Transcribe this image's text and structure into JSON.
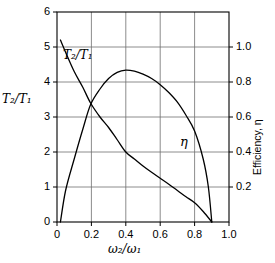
{
  "chart_data": {
    "type": "line",
    "title": "",
    "xlabel": "ω₂/ω₁",
    "ylabel_left": "T₂/T₁",
    "ylabel_right": "Efficiency, η",
    "xlim": [
      0.0,
      1.0
    ],
    "ylim_left": [
      0,
      6
    ],
    "ylim_right": [
      0.0,
      1.2
    ],
    "xticks": [
      "0",
      "0.2",
      "0.4",
      "0.6",
      "0.8",
      "1.0"
    ],
    "xtick_values": [
      0.0,
      0.2,
      0.4,
      0.6,
      0.8,
      1.0
    ],
    "yticks_left": [
      "0",
      "1",
      "2",
      "3",
      "4",
      "5",
      "6"
    ],
    "ytick_values_left": [
      0,
      1,
      2,
      3,
      4,
      5,
      6
    ],
    "yticks_right": [
      "0.2",
      "0.4",
      "0.6",
      "0.8",
      "1.0"
    ],
    "ytick_values_right": [
      0.2,
      0.4,
      0.6,
      0.8,
      1.0
    ],
    "grid": true,
    "legend_position": "inline-annotations",
    "series": [
      {
        "name": "T₂/T₁",
        "axis": "left",
        "label_text": "T₂/T₁",
        "label_x": 0.12,
        "label_y": 4.7,
        "x": [
          0.02,
          0.05,
          0.1,
          0.15,
          0.195,
          0.25,
          0.3,
          0.35,
          0.4,
          0.45,
          0.5,
          0.55,
          0.6,
          0.65,
          0.7,
          0.75,
          0.8,
          0.85,
          0.9
        ],
        "y": [
          5.2,
          4.85,
          4.3,
          3.85,
          3.4,
          3.0,
          2.7,
          2.35,
          2.0,
          1.8,
          1.6,
          1.42,
          1.25,
          1.08,
          0.9,
          0.72,
          0.55,
          0.3,
          0.0
        ]
      },
      {
        "name": "η",
        "axis": "right",
        "label_text": "η",
        "label_x": 0.72,
        "label_y": 0.45,
        "x": [
          0.02,
          0.05,
          0.1,
          0.15,
          0.195,
          0.25,
          0.3,
          0.35,
          0.4,
          0.45,
          0.5,
          0.55,
          0.6,
          0.65,
          0.7,
          0.75,
          0.8,
          0.85,
          0.88,
          0.9
        ],
        "y": [
          0.0,
          0.18,
          0.36,
          0.53,
          0.67,
          0.76,
          0.82,
          0.855,
          0.868,
          0.862,
          0.845,
          0.82,
          0.785,
          0.74,
          0.685,
          0.61,
          0.52,
          0.36,
          0.2,
          0.0
        ]
      }
    ]
  },
  "style": {
    "axis_color": "#000000",
    "grid_color": "#6e6e6e",
    "curve_color": "#000000",
    "background": "#ffffff"
  }
}
